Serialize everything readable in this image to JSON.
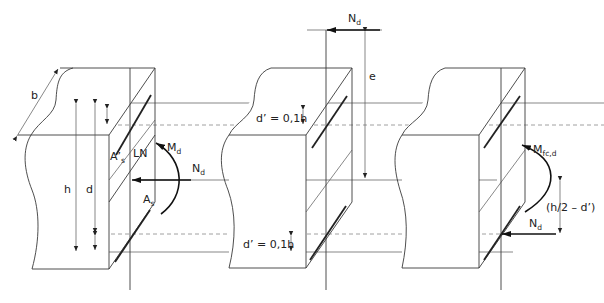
{
  "figure": {
    "colors": {
      "line": "#3a3a3a",
      "force": "#111111",
      "dashed": "#888888",
      "background": "#ffffff"
    }
  },
  "left_block": {
    "width_label": "b",
    "height_label": "h",
    "effective_depth_label": "d",
    "top_steel_label": "A’",
    "top_steel_sub": "s",
    "bottom_steel_label": "A",
    "bottom_steel_sub": "s",
    "neutral_line_label": "LN",
    "moment_label": "M",
    "moment_sub": "d",
    "axial_label": "N",
    "axial_sub": "d"
  },
  "middle_block": {
    "top_cover_label": "d’ = 0,1h",
    "bottom_cover_label": "d’ = 0,1h",
    "axial_label": "N",
    "axial_sub": "d",
    "eccentricity_label": "e"
  },
  "right_block": {
    "moment_label": "M",
    "moment_sub": "fc,d",
    "axial_label": "N",
    "axial_sub": "d",
    "lever_arm_label": "(h/2 – d’)"
  }
}
